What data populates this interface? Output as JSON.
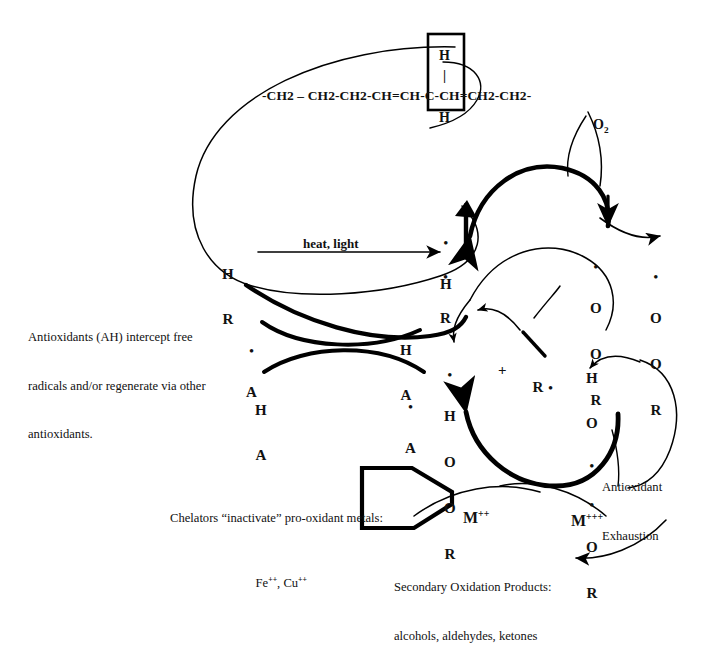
{
  "diagram": {
    "ink_color": "#000000",
    "background": "#ffffff"
  },
  "chain": {
    "formula": "-CH2 – CH2-CH2-CH=CH-C-CH=CH2-CH2-",
    "boxed_top_h": "H",
    "boxed_bond": "|",
    "boxed_bottom_h": "H"
  },
  "labels": {
    "oxygen": "O",
    "oxygen_sub": "2",
    "heat_light": "heat, light",
    "plus": "+",
    "antioxidant_note_line1": "Antioxidants (AH) intercept free",
    "antioxidant_note_line2": "radicals and/or regenerate via other",
    "antioxidant_note_line3": "antioxidants.",
    "chelator_line1": "Chelators “inactivate” pro-oxidant metals:",
    "chelator_line2_a": "Fe",
    "chelator_line2_a_sup": "++",
    "chelator_line2_sep": ", Cu",
    "chelator_line2_b_sup": "++",
    "metal_2plus": "M",
    "metal_2plus_sup": "++",
    "metal_3plus": "M",
    "metal_3plus_sup": "+++",
    "antioxidant_exhaustion_line1": "Antioxidant",
    "antioxidant_exhaustion_line2": "Exhaustion",
    "secondary_line1": "Secondary Oxidation Products:",
    "secondary_line2": "alcohols, aldehydes, ketones"
  },
  "species": {
    "lipid_RH": {
      "top": "H",
      "bottom": "R"
    },
    "h_radical": {
      "dot": "•",
      "atom": "H"
    },
    "r_radical": {
      "dot": "•",
      "atom": "R"
    },
    "peroxyl_1": {
      "dot": "•",
      "o1": "O",
      "o2": "O",
      "r": "R"
    },
    "peroxyl_2": {
      "dot": "•",
      "o1": "O",
      "o2": "O",
      "r": "R"
    },
    "hydroperoxide_left": {
      "dot": "•",
      "h": "H",
      "o1": "O",
      "o2": "O",
      "r": "R"
    },
    "hydroperoxide_right": {
      "h": "H",
      "o1": "O",
      "dot1": "•",
      "dot2": "•",
      "o2": "O",
      "r": "R"
    },
    "r_dot_free": {
      "atom": "R",
      "dot": "•"
    },
    "antiox_radical_left": {
      "dot": "•",
      "atom": "A"
    },
    "antiox_AH_right": {
      "top": "H",
      "bottom": "A"
    },
    "antiox_AH_left": {
      "top": "H",
      "bottom": "A"
    },
    "antiox_radical_right": {
      "dot": "•",
      "atom": "A"
    }
  }
}
